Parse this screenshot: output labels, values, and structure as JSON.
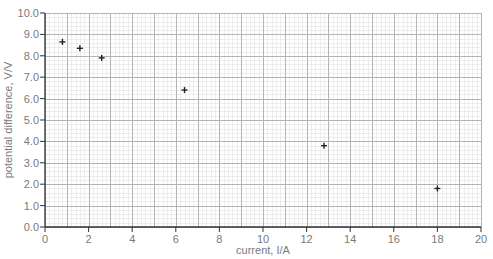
{
  "chart_data": {
    "type": "scatter",
    "title": "",
    "xlabel": "current, I/A",
    "ylabel": "potential difference, V/V",
    "xlim": [
      0,
      20
    ],
    "ylim": [
      0,
      10
    ],
    "x_ticks": [
      0,
      2,
      4,
      6,
      8,
      10,
      12,
      14,
      16,
      18,
      20
    ],
    "x_tick_labels": [
      "0",
      "2",
      "4",
      "6",
      "8",
      "10",
      "12",
      "14",
      "16",
      "18",
      "20"
    ],
    "y_ticks": [
      0,
      1,
      2,
      3,
      4,
      5,
      6,
      7,
      8,
      9,
      10
    ],
    "y_tick_labels": [
      "0.0",
      "1.0",
      "2.0",
      "3.0",
      "4.0",
      "5.0",
      "6.0",
      "7.0",
      "8.0",
      "9.0",
      "10.0"
    ],
    "grid": {
      "major_x": 1,
      "major_y": 1,
      "minor_x": 0.2,
      "minor_y": 0.2
    },
    "legend": null,
    "marker": "+",
    "series": [
      {
        "name": "measurements",
        "points": [
          {
            "x": 0.8,
            "y": 8.65
          },
          {
            "x": 1.6,
            "y": 8.35
          },
          {
            "x": 2.6,
            "y": 7.9
          },
          {
            "x": 6.4,
            "y": 6.4
          },
          {
            "x": 12.8,
            "y": 3.8
          },
          {
            "x": 18.0,
            "y": 1.8
          }
        ]
      }
    ]
  },
  "colors": {
    "minor_grid": "#e2e2e2",
    "major_grid": "#b4b4b4",
    "axis": "#333333",
    "marker": "#222222",
    "label": "#7a7a7a"
  }
}
